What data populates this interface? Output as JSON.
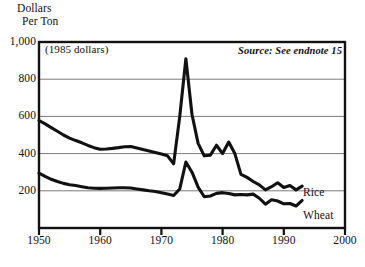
{
  "figure": {
    "y_axis_title_line1": "Dollars",
    "y_axis_title_line2": "Per Ton",
    "units_note": "(1985 dollars)",
    "source_note": "Source: See endnote 15",
    "rice_label": "Rice",
    "wheat_label": "Wheat",
    "line_color": "#111111",
    "grid_color": "#6b6b6b",
    "frame_color": "#111111",
    "background": "#ffffff"
  },
  "chart_data": {
    "type": "line",
    "title": "",
    "subtitle": "(1985 dollars)",
    "annotations": [
      "(1985 dollars)",
      "Source: See endnote 15"
    ],
    "xlabel": "",
    "ylabel": "Dollars Per Ton",
    "xlim": [
      1950,
      2000
    ],
    "ylim": [
      0,
      1000
    ],
    "xticks": [
      1950,
      1960,
      1970,
      1980,
      1990,
      2000
    ],
    "xtick_labels": [
      "1950",
      "1960",
      "1970",
      "1980",
      "1990",
      "2000"
    ],
    "yticks": [
      200,
      400,
      600,
      800,
      1000
    ],
    "ytick_labels": [
      "200",
      "400",
      "600",
      "800",
      "1,000"
    ],
    "grid": "horizontal",
    "legend": "inline-right-labels",
    "x": [
      1950,
      1951,
      1952,
      1953,
      1954,
      1955,
      1956,
      1957,
      1958,
      1959,
      1960,
      1961,
      1962,
      1963,
      1964,
      1965,
      1966,
      1967,
      1968,
      1969,
      1970,
      1971,
      1972,
      1973,
      1974,
      1975,
      1976,
      1977,
      1978,
      1979,
      1980,
      1981,
      1982,
      1983,
      1984,
      1985,
      1986,
      1987,
      1988,
      1989,
      1990,
      1991,
      1992,
      1993
    ],
    "series": [
      {
        "name": "Rice",
        "values": [
          578,
          560,
          540,
          520,
          500,
          483,
          470,
          458,
          444,
          432,
          423,
          425,
          428,
          432,
          437,
          438,
          430,
          422,
          414,
          406,
          398,
          388,
          345,
          600,
          910,
          610,
          455,
          388,
          392,
          445,
          400,
          462,
          400,
          288,
          272,
          250,
          232,
          205,
          222,
          243,
          218,
          228,
          205,
          225
        ]
      },
      {
        "name": "Wheat",
        "values": [
          295,
          278,
          262,
          250,
          240,
          233,
          228,
          222,
          216,
          214,
          213,
          214,
          215,
          216,
          216,
          215,
          210,
          205,
          200,
          196,
          190,
          183,
          175,
          210,
          355,
          300,
          220,
          168,
          172,
          186,
          190,
          185,
          178,
          180,
          178,
          182,
          160,
          128,
          152,
          145,
          130,
          132,
          118,
          148
        ]
      }
    ]
  }
}
